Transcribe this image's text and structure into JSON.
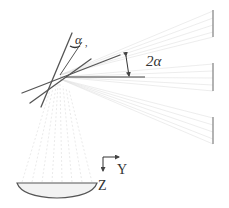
{
  "diagram": {
    "labels": {
      "alpha": "α",
      "alpha_sub": ",",
      "two_alpha": "2α",
      "axis_y": "Y",
      "axis_z": "Z"
    },
    "colors": {
      "stroke": "#555555",
      "faint_ray": "#d4d4d4",
      "detector": "#8a8a8a",
      "lens_fill": "#f2f2f2"
    },
    "elements": {
      "mirror_lines": 3,
      "reference_line": "horizontal",
      "detectors": 3,
      "lens": "plano-convex",
      "axes": [
        "Y",
        "Z"
      ]
    }
  }
}
